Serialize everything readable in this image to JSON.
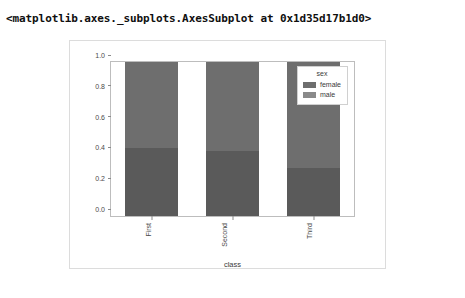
{
  "output": {
    "repr_text": "<matplotlib.axes._subplots.AxesSubplot at 0x1d35d17b1d0>"
  },
  "chart_data": {
    "type": "bar",
    "stacked": true,
    "normalized": true,
    "title": "",
    "xlabel": "class",
    "ylabel": "",
    "categories": [
      "First",
      "Second",
      "Third"
    ],
    "xtick_rotation": 90,
    "ylim": [
      0.0,
      1.0
    ],
    "yticks": [
      "0.0",
      "0.2",
      "0.4",
      "0.6",
      "0.8",
      "1.0"
    ],
    "ytick_values": [
      0.0,
      0.2,
      0.4,
      0.6,
      0.8,
      1.0
    ],
    "grid": false,
    "legend": {
      "title": "sex",
      "position": "upper right",
      "entries": [
        {
          "label": "female",
          "color": "#6e6e6e"
        },
        {
          "label": "male",
          "color": "#8a8a8a"
        }
      ]
    },
    "series": [
      {
        "name": "male",
        "values": [
          0.44,
          0.42,
          0.31
        ],
        "color": "#5a5a5a",
        "stack_position": "bottom"
      },
      {
        "name": "female",
        "values": [
          0.56,
          0.58,
          0.69
        ],
        "color": "#6e6e6e",
        "stack_position": "top"
      }
    ],
    "bar_totals": [
      1.0,
      1.0,
      1.0
    ]
  },
  "colors": {
    "panel_border": "#dcdcdc",
    "axes_border": "#bdbdbd",
    "tick_text": "#4a4a4a",
    "background": "#ffffff"
  }
}
